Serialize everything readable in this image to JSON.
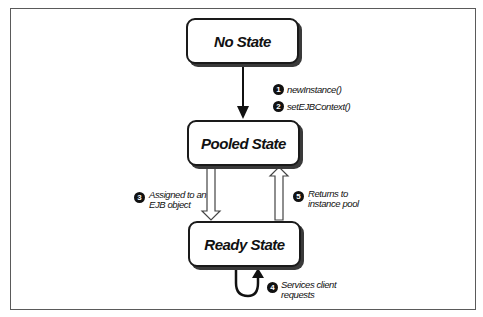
{
  "diagram": {
    "type": "state-lifecycle",
    "states": [
      {
        "id": "no-state",
        "label": "No State"
      },
      {
        "id": "pooled-state",
        "label": "Pooled State"
      },
      {
        "id": "ready-state",
        "label": "Ready State"
      }
    ],
    "transitions": [
      {
        "step": "1",
        "from": "no-state",
        "to": "pooled-state",
        "label": "newInstance()"
      },
      {
        "step": "2",
        "from": "no-state",
        "to": "pooled-state",
        "label": "setEJBContext()"
      },
      {
        "step": "3",
        "from": "pooled-state",
        "to": "ready-state",
        "label_line1": "Assigned to an",
        "label_line2": "EJB object"
      },
      {
        "step": "4",
        "from": "ready-state",
        "to": "ready-state",
        "label_line1": "Services client",
        "label_line2": "requests"
      },
      {
        "step": "5",
        "from": "ready-state",
        "to": "pooled-state",
        "label_line1": "Returns to",
        "label_line2": "instance pool"
      }
    ],
    "colors": {
      "line": "#111111",
      "frame": "#5a5a5a",
      "background": "#ffffff"
    }
  }
}
